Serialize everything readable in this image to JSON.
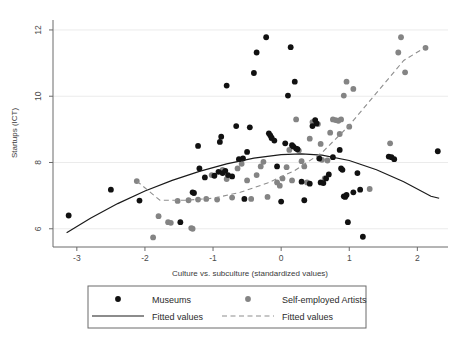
{
  "chart_data": {
    "type": "scatter",
    "title": "",
    "xlabel": "Culture vs. subculture (standardized values)",
    "ylabel": "Startups (ICT)",
    "xlim": [
      -3.35,
      2.45
    ],
    "ylim": [
      5.45,
      12.3
    ],
    "xticks": [
      -3,
      -2,
      -1,
      0,
      1,
      2
    ],
    "xtick_labels": [
      "-3",
      "-2",
      "-1",
      "0",
      "1",
      "2"
    ],
    "yticks": [
      6,
      8,
      10,
      12
    ],
    "ytick_labels": [
      "6",
      "8",
      "10",
      "12"
    ],
    "grid": "horizontal-faint",
    "legend_position": "below-axis",
    "colors": {
      "museums": "#111111",
      "artists": "#848484",
      "fit_museums": "#1a1a1a",
      "fit_artists": "#8e8e8e",
      "axis": "#6b6b6b",
      "grid": "#ebebeb"
    },
    "series": [
      {
        "name": "Museums",
        "marker": "filled-circle",
        "color": "#111111",
        "points": [
          [
            -3.12,
            6.4
          ],
          [
            -2.5,
            7.18
          ],
          [
            -2.08,
            6.85
          ],
          [
            -1.48,
            6.2
          ],
          [
            -1.3,
            7.1
          ],
          [
            -1.28,
            7.08
          ],
          [
            -1.22,
            8.5
          ],
          [
            -1.2,
            7.82
          ],
          [
            -1.12,
            7.55
          ],
          [
            -0.98,
            7.6
          ],
          [
            -0.92,
            7.72
          ],
          [
            -0.88,
            8.78
          ],
          [
            -0.9,
            8.62
          ],
          [
            -0.86,
            7.68
          ],
          [
            -0.82,
            7.75
          ],
          [
            -0.8,
            10.32
          ],
          [
            -0.78,
            7.62
          ],
          [
            -0.72,
            7.58
          ],
          [
            -0.66,
            9.1
          ],
          [
            -0.62,
            8.1
          ],
          [
            -0.56,
            8.12
          ],
          [
            -0.54,
            6.9
          ],
          [
            -0.5,
            8.32
          ],
          [
            -0.46,
            9.06
          ],
          [
            -0.4,
            10.7
          ],
          [
            -0.36,
            11.32
          ],
          [
            -0.22,
            11.78
          ],
          [
            -0.18,
            8.88
          ],
          [
            -0.16,
            8.82
          ],
          [
            -0.14,
            8.74
          ],
          [
            -0.1,
            8.66
          ],
          [
            -0.06,
            7.88
          ],
          [
            0.0,
            6.82
          ],
          [
            0.06,
            8.58
          ],
          [
            0.1,
            10.02
          ],
          [
            0.14,
            11.48
          ],
          [
            0.16,
            8.52
          ],
          [
            0.18,
            8.48
          ],
          [
            0.2,
            10.44
          ],
          [
            0.22,
            8.42
          ],
          [
            0.24,
            8.4
          ],
          [
            0.3,
            7.42
          ],
          [
            0.34,
            6.86
          ],
          [
            0.42,
            7.36
          ],
          [
            0.46,
            9.1
          ],
          [
            0.5,
            9.28
          ],
          [
            0.52,
            9.18
          ],
          [
            0.56,
            8.12
          ],
          [
            0.58,
            7.4
          ],
          [
            0.62,
            7.38
          ],
          [
            0.66,
            7.52
          ],
          [
            0.7,
            7.64
          ],
          [
            0.76,
            8.16
          ],
          [
            0.86,
            8.38
          ],
          [
            0.88,
            7.82
          ],
          [
            0.9,
            7.78
          ],
          [
            0.92,
            6.98
          ],
          [
            0.94,
            6.96
          ],
          [
            0.96,
            7.02
          ],
          [
            0.98,
            6.2
          ],
          [
            1.06,
            7.1
          ],
          [
            1.12,
            7.68
          ],
          [
            1.16,
            7.18
          ],
          [
            1.2,
            5.76
          ],
          [
            1.58,
            8.18
          ],
          [
            1.62,
            8.16
          ],
          [
            1.66,
            8.1
          ],
          [
            2.3,
            8.34
          ]
        ]
      },
      {
        "name": "Self-employed Artists",
        "marker": "filled-circle",
        "color": "#848484",
        "points": [
          [
            -2.12,
            7.44
          ],
          [
            -1.88,
            5.74
          ],
          [
            -1.8,
            6.38
          ],
          [
            -1.66,
            6.2
          ],
          [
            -1.62,
            6.18
          ],
          [
            -1.32,
            6.02
          ],
          [
            -1.3,
            6.0
          ],
          [
            -1.52,
            6.84
          ],
          [
            -1.36,
            6.86
          ],
          [
            -1.22,
            6.88
          ],
          [
            -1.1,
            6.9
          ],
          [
            -1.02,
            7.62
          ],
          [
            -0.94,
            6.88
          ],
          [
            -0.86,
            7.78
          ],
          [
            -0.8,
            7.5
          ],
          [
            -0.72,
            6.94
          ],
          [
            -0.64,
            7.82
          ],
          [
            -0.58,
            7.96
          ],
          [
            -0.5,
            7.46
          ],
          [
            -0.44,
            6.9
          ],
          [
            -0.36,
            7.62
          ],
          [
            -0.3,
            7.88
          ],
          [
            -0.26,
            8.02
          ],
          [
            -0.2,
            6.96
          ],
          [
            -0.14,
            8.74
          ],
          [
            -0.06,
            7.4
          ],
          [
            -0.02,
            7.3
          ],
          [
            0.02,
            7.52
          ],
          [
            0.08,
            7.86
          ],
          [
            0.12,
            8.38
          ],
          [
            0.16,
            7.46
          ],
          [
            0.22,
            9.3
          ],
          [
            0.26,
            8.36
          ],
          [
            0.3,
            8.04
          ],
          [
            0.34,
            7.88
          ],
          [
            0.38,
            7.4
          ],
          [
            0.42,
            8.72
          ],
          [
            0.46,
            9.22
          ],
          [
            0.5,
            9.26
          ],
          [
            0.54,
            9.16
          ],
          [
            0.58,
            8.56
          ],
          [
            0.6,
            8.08
          ],
          [
            0.64,
            7.52
          ],
          [
            0.68,
            8.06
          ],
          [
            0.72,
            8.9
          ],
          [
            0.76,
            9.3
          ],
          [
            0.8,
            9.28
          ],
          [
            0.84,
            9.26
          ],
          [
            0.86,
            8.86
          ],
          [
            0.88,
            9.3
          ],
          [
            0.92,
            10.02
          ],
          [
            0.96,
            10.44
          ],
          [
            1.0,
            9.08
          ],
          [
            1.06,
            10.22
          ],
          [
            1.3,
            7.2
          ],
          [
            1.6,
            8.58
          ],
          [
            1.72,
            11.32
          ],
          [
            1.76,
            11.78
          ],
          [
            1.82,
            10.72
          ],
          [
            2.12,
            11.46
          ]
        ]
      }
    ],
    "fitted_lines": [
      {
        "name": "Fitted values",
        "for": "Museums",
        "style": "solid",
        "color": "#1a1a1a",
        "shape": "quadratic-concave",
        "points": [
          [
            -3.15,
            5.88
          ],
          [
            -2.8,
            6.32
          ],
          [
            -2.4,
            6.76
          ],
          [
            -2.0,
            7.14
          ],
          [
            -1.6,
            7.46
          ],
          [
            -1.2,
            7.73
          ],
          [
            -0.8,
            7.96
          ],
          [
            -0.4,
            8.13
          ],
          [
            0.0,
            8.24
          ],
          [
            0.3,
            8.26
          ],
          [
            0.6,
            8.22
          ],
          [
            1.0,
            8.06
          ],
          [
            1.4,
            7.78
          ],
          [
            1.8,
            7.42
          ],
          [
            2.2,
            6.98
          ],
          [
            2.32,
            6.92
          ]
        ]
      },
      {
        "name": "Fitted values",
        "for": "Self-employed Artists",
        "style": "dashed",
        "color": "#8e8e8e",
        "shape": "piecewise-rising",
        "points": [
          [
            -2.12,
            7.44
          ],
          [
            -1.78,
            6.86
          ],
          [
            -1.4,
            6.86
          ],
          [
            -1.0,
            6.92
          ],
          [
            -0.6,
            7.1
          ],
          [
            -0.2,
            7.38
          ],
          [
            0.2,
            7.76
          ],
          [
            0.6,
            8.3
          ],
          [
            1.0,
            9.12
          ],
          [
            1.4,
            10.1
          ],
          [
            1.8,
            11.08
          ],
          [
            2.12,
            11.48
          ]
        ]
      }
    ],
    "legend": {
      "entries": [
        {
          "label": "Museums",
          "kind": "marker",
          "color": "#111111"
        },
        {
          "label": "Self-employed Artists",
          "kind": "marker",
          "color": "#848484"
        },
        {
          "label": "Fitted values",
          "kind": "line-solid",
          "color": "#1a1a1a"
        },
        {
          "label": "Fitted values",
          "kind": "line-dashed",
          "color": "#8e8e8e"
        }
      ]
    }
  }
}
